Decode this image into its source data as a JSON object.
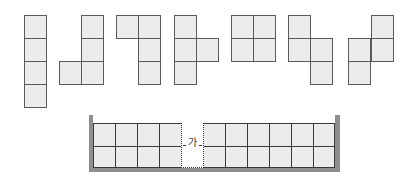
{
  "colors": {
    "cell_fill": "#ececec",
    "cell_border": "#5a5a5a",
    "wall": "#8f8f8f",
    "grid_line": "#3a3a3a"
  },
  "pieces": [
    {
      "name": "I-piece",
      "cells": [
        [
          24,
          15
        ],
        [
          24,
          38
        ],
        [
          24,
          61
        ],
        [
          24,
          84
        ]
      ]
    },
    {
      "name": "J-piece",
      "cells": [
        [
          81,
          15
        ],
        [
          81,
          38
        ],
        [
          81,
          61
        ],
        [
          59,
          61
        ]
      ]
    },
    {
      "name": "L-piece-rotated",
      "cells": [
        [
          116,
          15
        ],
        [
          138,
          15
        ],
        [
          138,
          38
        ],
        [
          138,
          61
        ]
      ]
    },
    {
      "name": "T-piece",
      "cells": [
        [
          174,
          15
        ],
        [
          174,
          38
        ],
        [
          174,
          61
        ],
        [
          196,
          38
        ]
      ]
    },
    {
      "name": "O-piece",
      "cells": [
        [
          231,
          15
        ],
        [
          253,
          15
        ],
        [
          231,
          38
        ],
        [
          253,
          38
        ]
      ]
    },
    {
      "name": "S-piece",
      "cells": [
        [
          288,
          15
        ],
        [
          288,
          38
        ],
        [
          310,
          38
        ],
        [
          310,
          61
        ]
      ]
    },
    {
      "name": "Z-piece",
      "cells": [
        [
          371,
          15
        ],
        [
          371,
          38
        ],
        [
          348,
          38
        ],
        [
          348,
          61
        ]
      ]
    }
  ],
  "board": {
    "columns": 11,
    "rows": 2,
    "gap_column_index": 4,
    "gap_label": "가"
  }
}
